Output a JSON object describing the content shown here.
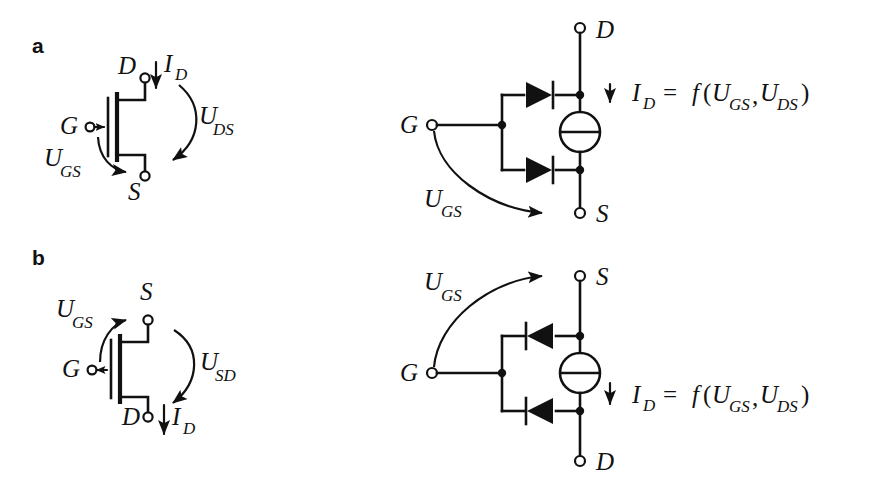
{
  "figure": {
    "background_color": "#ffffff",
    "ink_color": "#111111",
    "width": 872,
    "height": 494
  },
  "panels": [
    {
      "tag": "a",
      "description": "n-channel MOSFET symbol and equivalent circuit",
      "symbol": {
        "terminals": [
          {
            "name": "drain",
            "label": "D",
            "position": "top"
          },
          {
            "name": "gate",
            "label": "G",
            "position": "left"
          },
          {
            "name": "source",
            "label": "S",
            "position": "bottom"
          }
        ],
        "gate_arrow_direction": "right",
        "current_label": {
          "var": "I",
          "sub": "D",
          "arrow": "down"
        },
        "voltage_labels": [
          {
            "var": "U",
            "sub": "DS",
            "arrow": "curved-down"
          },
          {
            "var": "U",
            "sub": "GS",
            "arrow": "curved-down"
          }
        ]
      },
      "equivalent": {
        "terminals": [
          {
            "name": "drain",
            "label": "D",
            "position": "top"
          },
          {
            "name": "gate",
            "label": "G",
            "position": "left"
          },
          {
            "name": "source",
            "label": "S",
            "position": "bottom"
          }
        ],
        "diodes": [
          {
            "name": "upper-diode",
            "direction": "right"
          },
          {
            "name": "lower-diode",
            "direction": "right"
          }
        ],
        "source_symbol": "controlled-current-source",
        "current_label": {
          "var": "I",
          "sub": "D",
          "arrow": "down"
        },
        "voltage_label": {
          "var": "U",
          "sub": "GS",
          "arrow": "curved-right"
        },
        "equation": {
          "lhs_var": "I",
          "lhs_sub": "D",
          "equals": "=",
          "func": "f",
          "open_paren": "(",
          "arg1_var": "U",
          "arg1_sub": "GS",
          "comma": ",",
          "arg2_var": "U",
          "arg2_sub": "DS",
          "close_paren": ")",
          "plain": "I_D = f(U_GS, U_DS)"
        }
      }
    },
    {
      "tag": "b",
      "description": "p-channel MOSFET symbol and equivalent circuit",
      "symbol": {
        "terminals": [
          {
            "name": "source",
            "label": "S",
            "position": "top"
          },
          {
            "name": "gate",
            "label": "G",
            "position": "left"
          },
          {
            "name": "drain",
            "label": "D",
            "position": "bottom"
          }
        ],
        "gate_arrow_direction": "left",
        "current_label": {
          "var": "I",
          "sub": "D",
          "arrow": "down"
        },
        "voltage_labels": [
          {
            "var": "U",
            "sub": "SD",
            "arrow": "curved-down"
          },
          {
            "var": "U",
            "sub": "GS",
            "arrow": "curved-up"
          }
        ]
      },
      "equivalent": {
        "terminals": [
          {
            "name": "source",
            "label": "S",
            "position": "top"
          },
          {
            "name": "gate",
            "label": "G",
            "position": "left"
          },
          {
            "name": "drain",
            "label": "D",
            "position": "bottom"
          }
        ],
        "diodes": [
          {
            "name": "upper-diode",
            "direction": "left"
          },
          {
            "name": "lower-diode",
            "direction": "left"
          }
        ],
        "source_symbol": "controlled-current-source",
        "current_label": {
          "var": "I",
          "sub": "D",
          "arrow": "down"
        },
        "voltage_label": {
          "var": "U",
          "sub": "GS",
          "arrow": "curved-right"
        },
        "equation": {
          "lhs_var": "I",
          "lhs_sub": "D",
          "equals": "=",
          "func": "f",
          "open_paren": "(",
          "arg1_var": "U",
          "arg1_sub": "GS",
          "comma": ",",
          "arg2_var": "U",
          "arg2_sub": "DS",
          "close_paren": ")",
          "plain": "I_D = f(U_GS, U_DS)"
        }
      }
    }
  ],
  "labels": {
    "D": "D",
    "G": "G",
    "S": "S",
    "U": "U",
    "I": "I",
    "f": "f",
    "equals": "=",
    "comma": ",",
    "lparen": "(",
    "rparen": ")",
    "sub_D": "D",
    "sub_GS": "GS",
    "sub_DS": "DS",
    "sub_SD": "SD",
    "tag_a": "a",
    "tag_b": "b"
  }
}
